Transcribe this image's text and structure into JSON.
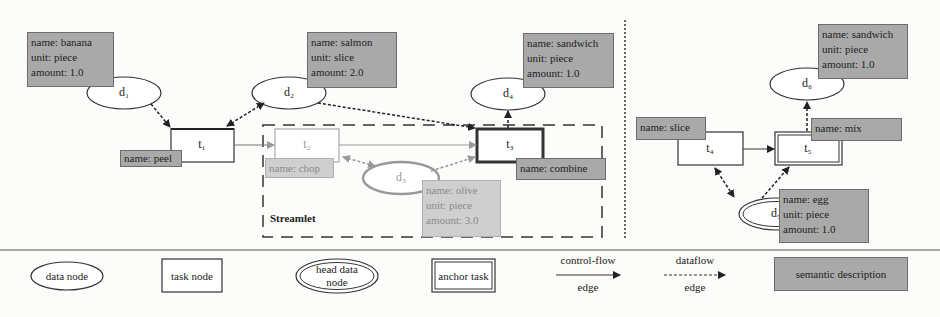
{
  "diagram": {
    "left_graph": {
      "data_nodes": [
        {
          "id": "d1",
          "label": "d₁",
          "semantic": {
            "name": "name: banana",
            "unit": "unit: piece",
            "amount": "amount: 1.0"
          }
        },
        {
          "id": "d2",
          "label": "d₂",
          "semantic": {
            "name": "name: salmon",
            "unit": "unit: slice",
            "amount": "amount: 2.0"
          }
        },
        {
          "id": "d3",
          "label": "d₃",
          "semantic": {
            "name": "name: olive",
            "unit": "unit: piece",
            "amount": "amount: 3.0"
          }
        },
        {
          "id": "d4",
          "label": "d₄",
          "semantic": {
            "name": "name: sandwich",
            "unit": "unit: piece",
            "amount": "amount: 1.0"
          }
        }
      ],
      "task_nodes": [
        {
          "id": "t1",
          "label": "t₁",
          "semantic": "name: peel"
        },
        {
          "id": "t2",
          "label": "t₂",
          "semantic": "name: chop"
        },
        {
          "id": "t3",
          "label": "t₃",
          "semantic": "name: combine",
          "anchor": true
        }
      ],
      "streamlet_label": "Streamlet"
    },
    "right_graph": {
      "data_nodes": [
        {
          "id": "d5",
          "label": "d₅",
          "head": true,
          "semantic": {
            "name": "name: egg",
            "unit": "unit: piece",
            "amount": "amount: 1.0"
          }
        },
        {
          "id": "d6",
          "label": "d₆",
          "semantic": {
            "name": "name: sandwich",
            "unit": "unit: piece",
            "amount": "amount: 1.0"
          }
        }
      ],
      "task_nodes": [
        {
          "id": "t4",
          "label": "t₄",
          "semantic": "name: slice"
        },
        {
          "id": "t5",
          "label": "t₅",
          "semantic": "name: mix",
          "anchor": true
        }
      ]
    },
    "legend": {
      "data_node": "data node",
      "task_node": "task node",
      "head_data_node_line1": "head data",
      "head_data_node_line2": "node",
      "anchor_task": "anchor task",
      "control_flow_line1": "control-flow",
      "control_flow_line2": "edge",
      "dataflow_line1": "dataflow",
      "dataflow_line2": "edge",
      "semantic_description": "semantic description"
    },
    "colors": {
      "semantic_fill": "#a9a9a9",
      "faded_fill": "#cfcfcf",
      "stroke": "#333333",
      "faded_stroke": "#9a9a9a"
    }
  }
}
